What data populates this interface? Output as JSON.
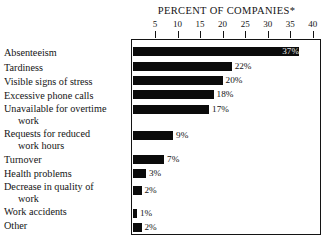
{
  "chart_data": {
    "type": "bar",
    "orientation": "horizontal",
    "title": "PERCENT OF COMPANIES*",
    "xlabel": "",
    "ylabel": "",
    "xlim": [
      0,
      41.5
    ],
    "grid": false,
    "legend": null,
    "axis_position": "top",
    "value_suffix": "%",
    "ticks": [
      {
        "value": 5,
        "label": "5"
      },
      {
        "value": 10,
        "label": "10"
      },
      {
        "value": 15,
        "label": "15"
      },
      {
        "value": 20,
        "label": "20"
      },
      {
        "value": 25,
        "label": "25"
      },
      {
        "value": 30,
        "label": "30"
      },
      {
        "value": 35,
        "label": "35"
      },
      {
        "value": 40,
        "label": "40"
      }
    ],
    "categories": [
      "Absenteeism",
      "Tardiness",
      "Visible signs of stress",
      "Excessive phone calls",
      "Unavailable for overtime\nwork",
      "Requests for reduced\nwork hours",
      "Turnover",
      "Health problems",
      "Decrease in quality of\nwork",
      "Work accidents",
      "Other"
    ],
    "values": [
      37,
      22,
      20,
      18,
      17,
      9,
      7,
      3,
      2,
      1,
      2
    ],
    "value_labels": [
      "37%",
      "22%",
      "20%",
      "18%",
      "17%",
      "9%",
      "7%",
      "3%",
      "2%",
      "1%",
      "2%"
    ],
    "bar_color": "#0b0b0b",
    "frame_color": "#141414",
    "background": "#ffffff"
  },
  "rows": [
    {
      "label": "Absenteeism",
      "label_lines": [
        "Absenteeism"
      ],
      "value": 37,
      "value_label": "37%",
      "label_top": 8,
      "bar_top": 6,
      "value_inside": true
    },
    {
      "label": "Tardiness",
      "label_lines": [
        "Tardiness"
      ],
      "value": 22,
      "value_label": "22%",
      "label_top": 23,
      "bar_top": 21,
      "value_inside": false
    },
    {
      "label": "Visible signs of stress",
      "label_lines": [
        "Visible signs of stress"
      ],
      "value": 20,
      "value_label": "20%",
      "label_top": 37,
      "bar_top": 35,
      "value_inside": false
    },
    {
      "label": "Excessive phone calls",
      "label_lines": [
        "Excessive phone calls"
      ],
      "value": 18,
      "value_label": "18%",
      "label_top": 51,
      "bar_top": 49,
      "value_inside": false
    },
    {
      "label": "Unavailable for overtime work",
      "label_lines": [
        "Unavailable for overtime",
        "work"
      ],
      "value": 17,
      "value_label": "17%",
      "label_top": 64,
      "bar_top": 64,
      "value_inside": false
    },
    {
      "label": "Requests for reduced work hours",
      "label_lines": [
        "Requests for reduced",
        "work hours"
      ],
      "value": 9,
      "value_label": "9%",
      "label_top": 89,
      "bar_top": 90,
      "value_inside": false
    },
    {
      "label": "Turnover",
      "label_lines": [
        "Turnover"
      ],
      "value": 7,
      "value_label": "7%",
      "label_top": 115,
      "bar_top": 114,
      "value_inside": false
    },
    {
      "label": "Health problems",
      "label_lines": [
        "Health problems"
      ],
      "value": 3,
      "value_label": "3%",
      "label_top": 129,
      "bar_top": 128,
      "value_inside": false
    },
    {
      "label": "Decrease in quality of work",
      "label_lines": [
        "Decrease in quality of",
        "work"
      ],
      "value": 2,
      "value_label": "2%",
      "label_top": 142,
      "bar_top": 145,
      "value_inside": false
    },
    {
      "label": "Work accidents",
      "label_lines": [
        "Work accidents"
      ],
      "value": 1,
      "value_label": "1%",
      "label_top": 167,
      "bar_top": 168,
      "value_inside": false
    },
    {
      "label": "Other",
      "label_lines": [
        "Other"
      ],
      "value": 2,
      "value_label": "2%",
      "label_top": 181,
      "bar_top": 182,
      "value_inside": false
    }
  ]
}
